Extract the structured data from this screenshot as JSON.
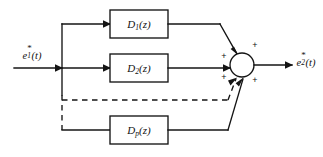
{
  "diagram": {
    "type": "control-system-block-diagram",
    "width": 323,
    "height": 157,
    "background_color": "#ffffff",
    "line_color": "#141414"
  },
  "signals": {
    "input": {
      "name": "input-signal",
      "base": "e",
      "subscript": "1",
      "superscript": "*",
      "argument": "(t)",
      "text": "e1*(t)"
    },
    "output": {
      "name": "output-signal",
      "base": "e",
      "subscript": "2",
      "superscript": "*",
      "argument": "(t)",
      "text": "e2*(t)"
    }
  },
  "blocks": [
    {
      "id": "block-d1",
      "base": "D",
      "subscript": "1",
      "argument": "(z)",
      "text": "D1(z)",
      "x": 139,
      "y": 24
    },
    {
      "id": "block-d2",
      "base": "D",
      "subscript": "2",
      "argument": "(z)",
      "text": "D2(z)",
      "x": 139,
      "y": 68
    },
    {
      "id": "block-dp",
      "base": "D",
      "subscript": "p",
      "argument": "(z)",
      "text": "Dp(z)",
      "x": 139,
      "y": 130
    }
  ],
  "summing_junction": {
    "name": "summing-junction",
    "cx": 242,
    "cy": 65,
    "r": 12,
    "signs": [
      {
        "id": "sign-top",
        "label": "+",
        "x": 255,
        "y": 45
      },
      {
        "id": "sign-left",
        "label": "+",
        "x": 224,
        "y": 56
      },
      {
        "id": "sign-lower-left",
        "label": "+",
        "x": 224,
        "y": 77
      },
      {
        "id": "sign-lower-right",
        "label": "+",
        "x": 255,
        "y": 80
      }
    ]
  },
  "annotations": {
    "continuation": "dashed lines indicate additional parallel controller paths"
  }
}
